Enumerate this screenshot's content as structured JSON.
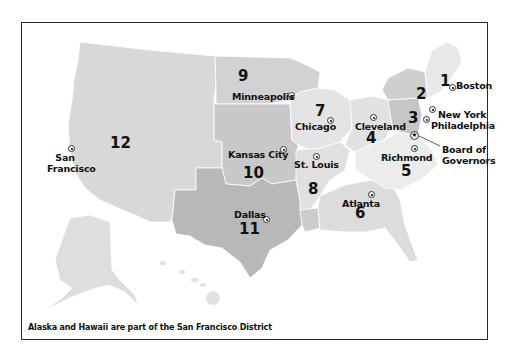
{
  "footnote": "Alaska and Hawaii are part of the San Francisco District",
  "colors": {
    "district_light": "#e6e6e6",
    "district_mid": "#d6d6d6",
    "district_dark": "#c4c4c4",
    "district_darker": "#b5b5b5",
    "border": "#2a2a2a",
    "state_line": "#ffffff"
  },
  "districts": [
    {
      "number": "1",
      "city": "Boston"
    },
    {
      "number": "2",
      "city": "New York"
    },
    {
      "number": "3",
      "city": "Philadelphia"
    },
    {
      "number": "4",
      "city": "Cleveland"
    },
    {
      "number": "5",
      "city": "Richmond"
    },
    {
      "number": "6",
      "city": "Atlanta"
    },
    {
      "number": "7",
      "city": "Chicago"
    },
    {
      "number": "8",
      "city": "St. Louis"
    },
    {
      "number": "9",
      "city": "Minneapolis"
    },
    {
      "number": "10",
      "city": "Kansas City"
    },
    {
      "number": "11",
      "city": "Dallas"
    },
    {
      "number": "12",
      "city": "San Francisco"
    }
  ],
  "board": {
    "line1": "Board of",
    "line2": "Governors"
  },
  "icons": {
    "reserve_bank": "circle-dot-icon",
    "board_of_governors": "star-icon"
  }
}
